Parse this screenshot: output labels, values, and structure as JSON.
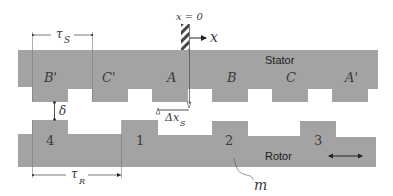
{
  "colors": {
    "iron": "#a3a3a3",
    "line": "#555555",
    "text": "#333333",
    "background": "#ffffff"
  },
  "origin": {
    "label": "x = 0",
    "axis_label": "x"
  },
  "stator": {
    "label": "Stator",
    "poles": [
      {
        "label": "B'",
        "x": 32
      },
      {
        "label": "C'",
        "x": 92
      },
      {
        "label": "A",
        "x": 152
      },
      {
        "label": "B",
        "x": 212
      },
      {
        "label": "C",
        "x": 272
      },
      {
        "label": "A'",
        "x": 332
      }
    ],
    "pitch_label": "τ",
    "pitch_subscript": "S"
  },
  "rotor": {
    "label": "Rotor",
    "teeth": [
      {
        "label": "4",
        "x": 32
      },
      {
        "label": "1",
        "x": 122
      },
      {
        "label": "2",
        "x": 212
      },
      {
        "label": "3",
        "x": 300
      }
    ],
    "pitch_label": "τ",
    "pitch_subscript": "R",
    "motion_indicator": "double-arrow"
  },
  "annotations": {
    "airgap_label": "δ",
    "offset_label": "Δx",
    "offset_subscript": "S",
    "mass_label": "m"
  }
}
